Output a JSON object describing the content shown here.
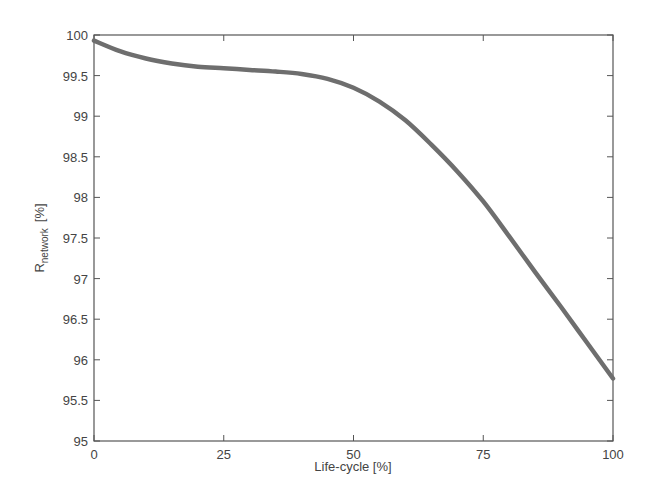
{
  "chart_data": {
    "type": "line",
    "title": "",
    "xlabel": "Life-cycle  [%]",
    "ylabel_main": "R",
    "ylabel_sub": "network",
    "ylabel_unit": "[%]",
    "xlim": [
      0,
      100
    ],
    "ylim": [
      95,
      100
    ],
    "x_ticks": [
      0,
      25,
      50,
      75,
      100
    ],
    "y_ticks": [
      95,
      95.5,
      96,
      96.5,
      97,
      97.5,
      98,
      98.5,
      99,
      99.5,
      100
    ],
    "grid": false,
    "legend": null,
    "series": [
      {
        "name": "R_network",
        "color": "#6e6e6e",
        "x": [
          0,
          5,
          10,
          15,
          20,
          25,
          30,
          35,
          40,
          45,
          50,
          55,
          60,
          65,
          70,
          75,
          80,
          85,
          90,
          95,
          100
        ],
        "y": [
          99.93,
          99.8,
          99.71,
          99.65,
          99.61,
          99.59,
          99.57,
          99.55,
          99.52,
          99.46,
          99.35,
          99.18,
          98.95,
          98.65,
          98.32,
          97.95,
          97.52,
          97.08,
          96.65,
          96.21,
          95.77
        ]
      }
    ]
  }
}
